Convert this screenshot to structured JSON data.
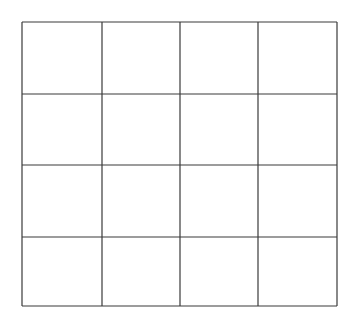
{
  "grid": {
    "rows": 4,
    "cols": 4,
    "line_color": "#3a3a3a",
    "background": "#ffffff",
    "x_lines": [
      22,
      102,
      180,
      258,
      337
    ],
    "y_lines": [
      22,
      94,
      165,
      237,
      306
    ]
  }
}
